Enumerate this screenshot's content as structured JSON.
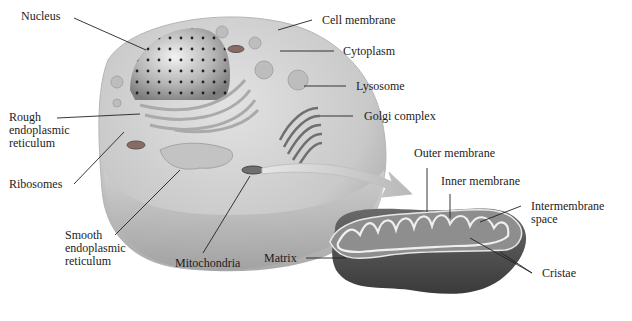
{
  "diagram": {
    "cell_labels": [
      {
        "id": "nucleus",
        "text": "Nucleus"
      },
      {
        "id": "cell-membrane",
        "text": "Cell membrane"
      },
      {
        "id": "cytoplasm",
        "text": "Cytoplasm"
      },
      {
        "id": "lysosome",
        "text": "Lysosome"
      },
      {
        "id": "golgi-complex",
        "text": "Golgi complex"
      },
      {
        "id": "rough-er",
        "lines": [
          "Rough",
          "endoplasmic",
          "reticulum"
        ]
      },
      {
        "id": "ribosomes",
        "text": "Ribosomes"
      },
      {
        "id": "smooth-er",
        "lines": [
          "Smooth",
          "endoplasmic",
          "reticulum"
        ]
      },
      {
        "id": "mitochondria",
        "text": "Mitochondria"
      }
    ],
    "mitochondrion_labels": [
      {
        "id": "outer-membrane",
        "text": "Outer membrane"
      },
      {
        "id": "inner-membrane",
        "text": "Inner membrane"
      },
      {
        "id": "intermembrane-space",
        "lines": [
          "Intermembrane",
          "space"
        ]
      },
      {
        "id": "matrix",
        "text": "Matrix"
      },
      {
        "id": "cristae",
        "text": "Cristae"
      }
    ]
  }
}
